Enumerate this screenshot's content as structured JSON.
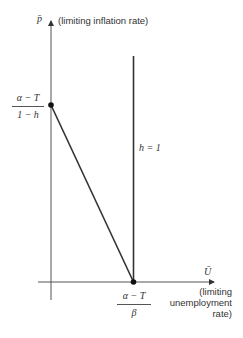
{
  "diagram": {
    "y_axis": {
      "symbol": "p̄",
      "label": "(limiting inflation rate)"
    },
    "x_axis": {
      "symbol": "Ū",
      "label_lines": [
        "(limiting",
        "unemployment",
        "rate)"
      ]
    },
    "y_intercept": {
      "numerator": "α − T",
      "denominator": "1 − h"
    },
    "x_intercept": {
      "numerator": "α − T",
      "denominator": "β"
    },
    "vertical_line_label": "h = 1",
    "colors": {
      "line": "#333333",
      "axis": "#555555",
      "background": "#ffffff"
    }
  }
}
